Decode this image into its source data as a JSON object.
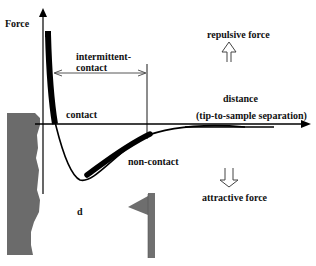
{
  "diagram": {
    "axis": {
      "y_label": "Force",
      "x_label_line1": "distance",
      "x_label_line2": "(tip-to-sample separation)"
    },
    "regions": {
      "intermittent_line1": "intermittent-",
      "intermittent_line2": "contact",
      "contact": "contact",
      "non_contact": "non-contact"
    },
    "forces": {
      "repulsive": "repulsive force",
      "attractive": "attractive force"
    },
    "distance_symbol": "d",
    "colors": {
      "curve": "#000000",
      "sample": "#6b6b6b",
      "tip": "#707070",
      "background": "#ffffff"
    }
  }
}
